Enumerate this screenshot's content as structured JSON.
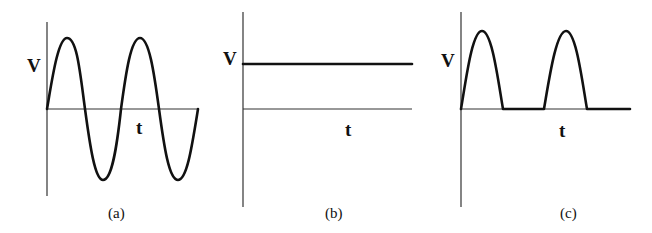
{
  "panels": [
    {
      "id": "a",
      "caption": "(a)",
      "y_label": "V",
      "x_label": "t",
      "waveform": "sine (alternating voltage)",
      "cycles_shown": 2
    },
    {
      "id": "b",
      "caption": "(b)",
      "y_label": "V",
      "x_label": "t",
      "waveform": "constant (direct voltage)"
    },
    {
      "id": "c",
      "caption": "(c)",
      "y_label": "V",
      "x_label": "t",
      "waveform": "half-wave rectified sine",
      "pulses_shown": 2
    }
  ],
  "colors": {
    "line": "#111111",
    "axis": "#333333",
    "background": "#ffffff"
  }
}
